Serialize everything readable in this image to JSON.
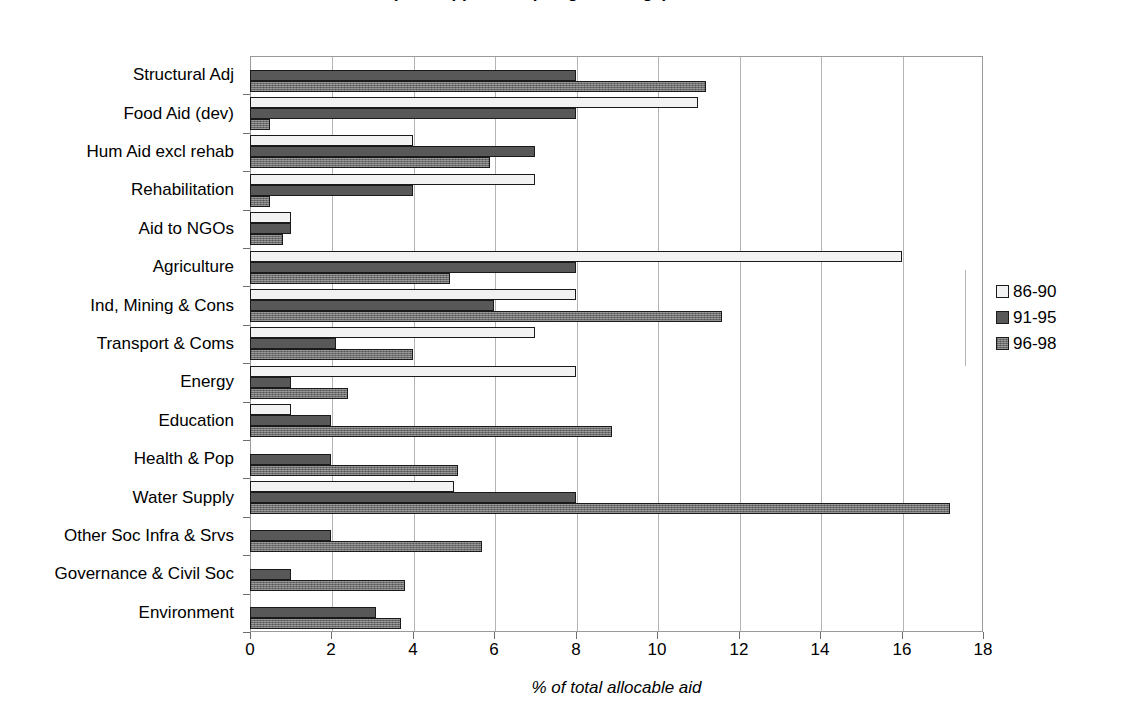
{
  "chart_data": {
    "type": "bar",
    "orientation": "horizontal",
    "title": "(title clipped at top edge of image)",
    "xlabel": "% of total allocable aid",
    "ylabel": "",
    "xlim": [
      0,
      18
    ],
    "xticks": [
      0,
      2,
      4,
      6,
      8,
      10,
      12,
      14,
      16,
      18
    ],
    "grid": "vertical",
    "legend_position": "right",
    "categories": [
      "Structural Adj",
      "Food Aid (dev)",
      "Hum Aid excl rehab",
      "Rehabilitation",
      "Aid to NGOs",
      "Agriculture",
      "Ind, Mining & Cons",
      "Transport & Coms",
      "Energy",
      "Education",
      "Health & Pop",
      "Water Supply",
      "Other Soc Infra & Srvs",
      "Governance & Civil Soc",
      "Environment"
    ],
    "series": [
      {
        "name": "86-90",
        "color": "#f2f2f2",
        "values": [
          0,
          11.0,
          4.0,
          7.0,
          1.0,
          16.0,
          8.0,
          7.0,
          8.0,
          1.0,
          0,
          5.0,
          0,
          0,
          0
        ]
      },
      {
        "name": "91-95",
        "color": "#585858",
        "values": [
          8.0,
          8.0,
          7.0,
          4.0,
          1.0,
          8.0,
          6.0,
          2.1,
          1.0,
          2.0,
          2.0,
          8.0,
          2.0,
          1.0,
          3.1
        ]
      },
      {
        "name": "96-98",
        "color": "#6e6e6e",
        "values": [
          11.2,
          0.5,
          5.9,
          0.5,
          0.8,
          4.9,
          11.6,
          4.0,
          2.4,
          8.9,
          5.1,
          17.2,
          5.7,
          3.8,
          3.7
        ]
      }
    ]
  },
  "legend": {
    "items": [
      {
        "label": "86-90",
        "swatch": "legend-swatch-86-90"
      },
      {
        "label": "91-95",
        "swatch": "legend-swatch-91-95"
      },
      {
        "label": "96-98",
        "swatch": "legend-swatch-96-98"
      }
    ]
  }
}
